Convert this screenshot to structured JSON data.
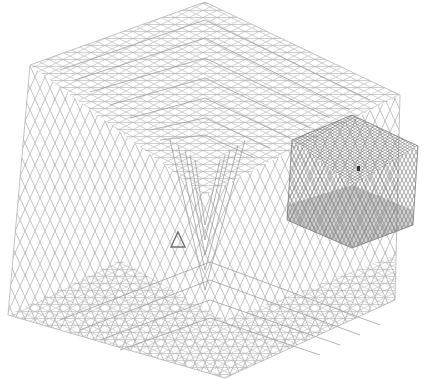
{
  "artwork": {
    "title": "Wireframe lattice cubes",
    "background_color": "#ffffff",
    "line_color": "#9a9a9a",
    "dark_line_color": "#6e6e6e",
    "large_cube": {
      "vertices": [
        [
          205,
          2
        ],
        [
          400,
          95
        ],
        [
          395,
          300
        ],
        [
          225,
          378
        ],
        [
          8,
          315
        ],
        [
          30,
          65
        ]
      ],
      "center": [
        205,
        195
      ],
      "nested_layers": 8
    },
    "small_cube": {
      "vertices": [
        [
          352,
          115
        ],
        [
          418,
          146
        ],
        [
          413,
          225
        ],
        [
          352,
          248
        ],
        [
          287,
          220
        ],
        [
          292,
          140
        ]
      ],
      "center": [
        352,
        185
      ]
    },
    "triangle": {
      "points": [
        [
          171,
          247
        ],
        [
          185,
          247
        ],
        [
          178,
          232
        ]
      ],
      "color": "#707070"
    }
  }
}
